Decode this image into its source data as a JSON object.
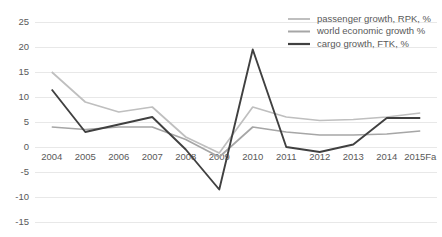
{
  "chart_data": {
    "type": "line",
    "title": "",
    "xlabel": "",
    "ylabel": "",
    "ylim": [
      -15,
      25
    ],
    "yticks": [
      25,
      20,
      15,
      10,
      5,
      0,
      -5,
      -10,
      -15
    ],
    "grid": true,
    "legend_position": "top-right",
    "categories": [
      "2004",
      "2005",
      "2006",
      "2007",
      "2008",
      "2009",
      "2010",
      "2011",
      "2012",
      "2013",
      "2014",
      "2015Fa"
    ],
    "series": [
      {
        "name": "passenger growth, RPK, %",
        "color": "#bfbfbf",
        "values": [
          15,
          9,
          7,
          8,
          2,
          -1.2,
          8,
          6,
          5.3,
          5.5,
          6,
          6.8
        ]
      },
      {
        "name": "world economic growth %",
        "color": "#a6a6a6",
        "values": [
          4,
          3.5,
          4,
          4,
          1.5,
          -2,
          4,
          3,
          2.4,
          2.4,
          2.6,
          3.2
        ]
      },
      {
        "name": "cargo growth, FTK, %",
        "color": "#404040",
        "values": [
          11.5,
          3,
          4.5,
          6,
          -0.5,
          -8.5,
          19.5,
          0,
          -1,
          0.5,
          5.8,
          5.8
        ]
      }
    ]
  },
  "axis": {
    "ytick_labels": [
      "25",
      "20",
      "15",
      "10",
      "5",
      "0",
      "-5",
      "-10",
      "-15"
    ],
    "xtick_labels": [
      "2004",
      "2005",
      "2006",
      "2007",
      "2008",
      "2009",
      "2010",
      "2011",
      "2012",
      "2013",
      "2014",
      "2015Fa"
    ]
  },
  "legend": {
    "items": [
      {
        "label": "passenger growth, RPK, %",
        "color": "#bfbfbf"
      },
      {
        "label": "world economic growth %",
        "color": "#a6a6a6"
      },
      {
        "label": "cargo growth, FTK, %",
        "color": "#404040"
      }
    ]
  },
  "colors": {
    "background": "#ffffff",
    "gridline": "#e8e8e8",
    "tick_text": "#595959"
  }
}
